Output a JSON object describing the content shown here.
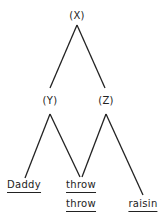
{
  "diagram": {
    "type": "tree",
    "nodes": [
      {
        "id": "X",
        "label": "(X)"
      },
      {
        "id": "Y",
        "label": "(Y)"
      },
      {
        "id": "Z",
        "label": "(Z)"
      }
    ],
    "leaves": [
      {
        "id": "daddy",
        "label": "Daddy"
      },
      {
        "id": "throw1",
        "label": "throw"
      },
      {
        "id": "throw2",
        "label": "throw"
      },
      {
        "id": "raisin",
        "label": "raisin"
      }
    ],
    "edges": [
      {
        "from": "X",
        "to": "Y"
      },
      {
        "from": "X",
        "to": "Z"
      },
      {
        "from": "Y",
        "to": "daddy"
      },
      {
        "from": "Y",
        "to": "throw1"
      },
      {
        "from": "Z",
        "to": "throw1"
      },
      {
        "from": "Z",
        "to": "raisin"
      }
    ],
    "line_color": "#222222"
  }
}
